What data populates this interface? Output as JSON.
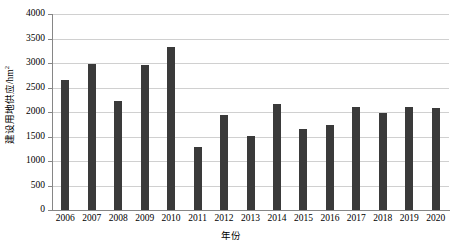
{
  "chart_data": {
    "type": "bar",
    "title": "",
    "xlabel": "年份",
    "ylabel": "建设用地供应/hm",
    "ylabel_superscript": "2",
    "categories": [
      "2006",
      "2007",
      "2008",
      "2009",
      "2010",
      "2011",
      "2012",
      "2013",
      "2014",
      "2015",
      "2016",
      "2017",
      "2018",
      "2019",
      "2020"
    ],
    "values": [
      2650,
      2980,
      2230,
      2960,
      3330,
      1280,
      1940,
      1510,
      2160,
      1650,
      1740,
      2100,
      1980,
      2110,
      2090
    ],
    "ylim": [
      0,
      4000
    ],
    "yticks": [
      0,
      500,
      1000,
      1500,
      2000,
      2500,
      3000,
      3500,
      4000
    ],
    "ytick_labels": [
      "0",
      "500",
      "1000",
      "1500",
      "2000",
      "2500",
      "3000",
      "3500",
      "4000"
    ],
    "grid": true,
    "grid_axis": "y",
    "legend": false,
    "bar_color": "#3a3a3a",
    "grid_color": "#d0d0d0",
    "axis_color": "#868686",
    "background_color": "#ffffff"
  }
}
